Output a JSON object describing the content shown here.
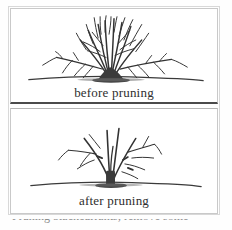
{
  "figure": {
    "type": "line-drawing-illustration",
    "width_px": 232,
    "height_px": 230,
    "background_color": "#fefefe",
    "ink_color": "#333333",
    "frame_color": "#c9c9c9"
  },
  "panels": [
    {
      "id": "before",
      "caption": "before pruning",
      "description": "dense bare shrub with many upright stems and fine twigs",
      "ground_line": true
    },
    {
      "id": "after",
      "caption": "after pruning",
      "description": "thinned bare shrub with few remaining stems and cut stubs",
      "ground_line": true
    }
  ],
  "footer": {
    "cut_off_line": "Pruning blackcurrants; remove some"
  }
}
